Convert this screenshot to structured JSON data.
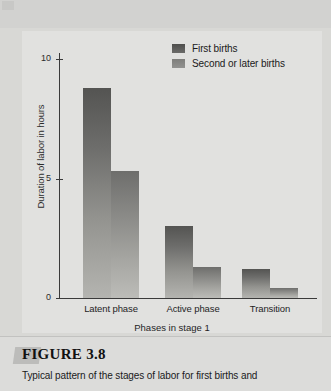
{
  "figure": {
    "number_label": "FIGURE 3.8",
    "caption": "Typical pattern of the stages of labor for first births and"
  },
  "chart_data": {
    "type": "bar",
    "title": "",
    "categories": [
      "Latent phase",
      "Active phase",
      "Transition"
    ],
    "series": [
      {
        "name": "First births",
        "values": [
          8.8,
          3.0,
          1.2
        ],
        "color": "#5a5a58"
      },
      {
        "name": "Second or later births",
        "values": [
          5.3,
          1.3,
          0.4
        ],
        "color": "#8c8c89"
      }
    ],
    "xlabel": "Phases in stage 1",
    "ylabel": "Duration of labor in hours",
    "ylim": [
      0,
      11.5
    ],
    "yticks": [
      0,
      5,
      10
    ],
    "ytick_labels": [
      "0",
      "5",
      "10"
    ],
    "grid": false,
    "legend_position": "top-right"
  },
  "legend": {
    "items": [
      {
        "label": "First births"
      },
      {
        "label": "Second or later births"
      }
    ]
  },
  "colors": {
    "page_background": "#d8d8d5",
    "panel_background": "#e1e1df",
    "axis": "#3a3a3a",
    "text": "#1a1a1a"
  }
}
